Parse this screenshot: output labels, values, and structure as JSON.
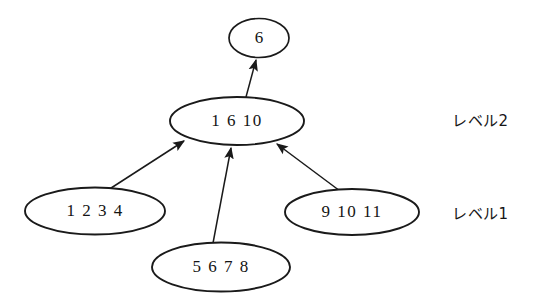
{
  "diagram": {
    "type": "hierarchical-lattice",
    "background_color": "#ffffff",
    "stroke_color": "#1a1a1a",
    "text_color": "#141414",
    "nodes": [
      {
        "id": "top",
        "label": "6",
        "cx": 259,
        "cy": 38,
        "rx": 30,
        "ry": 19.5
      },
      {
        "id": "level2-node",
        "label": "1 6 10",
        "cx": 237,
        "cy": 121,
        "rx": 67,
        "ry": 24
      },
      {
        "id": "level1-left",
        "label": "1 2 3 4",
        "cx": 95,
        "cy": 211,
        "rx": 70,
        "ry": 23.5
      },
      {
        "id": "level1-middle",
        "label": "5 6 7 8",
        "cx": 221,
        "cy": 267,
        "rx": 69,
        "ry": 24.5
      },
      {
        "id": "level1-right",
        "label": "9 10 11",
        "cx": 352,
        "cy": 212,
        "rx": 67,
        "ry": 23
      }
    ],
    "edges": [
      {
        "id": "edge-level2-to-top",
        "from": "level2-node",
        "to": "top",
        "x1": 246,
        "y1": 97,
        "x2": 256,
        "y2": 60
      },
      {
        "id": "edge-left-to-level2",
        "from": "level1-left",
        "to": "level2-node",
        "x1": 108,
        "y1": 190,
        "x2": 184,
        "y2": 141
      },
      {
        "id": "edge-middle-to-level2",
        "from": "level1-middle",
        "to": "level2-node",
        "x1": 213,
        "y1": 243,
        "x2": 231,
        "y2": 148
      },
      {
        "id": "edge-right-to-level2",
        "from": "level1-right",
        "to": "level2-node",
        "x1": 340,
        "y1": 191,
        "x2": 277,
        "y2": 144
      }
    ],
    "level_labels": [
      {
        "id": "label-level-2",
        "text": "レベル2",
        "x": 452,
        "y": 121
      },
      {
        "id": "label-level-1",
        "text": "レベル1",
        "x": 452,
        "y": 214
      }
    ]
  }
}
